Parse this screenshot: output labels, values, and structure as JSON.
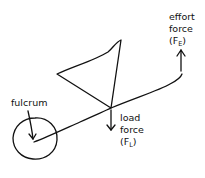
{
  "diagram": {
    "labels": {
      "fulcrum": "fulcrum",
      "load_line1": "load",
      "load_line2": "force",
      "load_symbol": "(F",
      "load_sub": "L",
      "load_close": ")",
      "effort_line1": "effort",
      "effort_line2": "force",
      "effort_symbol": "(F",
      "effort_sub": "E",
      "effort_close": ")"
    },
    "colors": {
      "ink": "#111111",
      "background": "#ffffff"
    }
  }
}
